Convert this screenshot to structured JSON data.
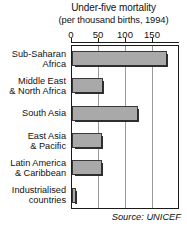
{
  "chart_data": {
    "type": "bar",
    "orientation": "horizontal",
    "title": "Under-five mortality",
    "subtitle": "(per thousand births, 1994)",
    "xlabel": "",
    "ylabel": "",
    "xlim": [
      0,
      200
    ],
    "grid": true,
    "legend": null,
    "ticks": [
      {
        "value": 0,
        "label": "0"
      },
      {
        "value": 50,
        "label": "50"
      },
      {
        "value": 100,
        "label": "100"
      },
      {
        "value": 150,
        "label": "150"
      }
    ],
    "categories": [
      "Sub-Saharan Africa",
      "Middle East & North Africa",
      "South Asia",
      "East Asia & Pacific",
      "Latin America & Caribbean",
      "Industrialised countries"
    ],
    "category_lines": [
      [
        "Sub-Saharan",
        "Africa"
      ],
      [
        "Middle East",
        "& North Africa"
      ],
      [
        "South Asia",
        ""
      ],
      [
        "East Asia",
        "& Pacific"
      ],
      [
        "Latin America",
        "& Caribbean"
      ],
      [
        "Industrialised",
        "countries"
      ]
    ],
    "values": [
      175,
      57,
      122,
      55,
      55,
      8
    ],
    "bar_color": "#a9a9a9",
    "bar_edge_color": "#3a3a3a",
    "grid_color": "#9a9a9a",
    "axis_color": "#1a1a1a"
  },
  "source": {
    "prefix": "Source:",
    "name": "UNICEF"
  }
}
